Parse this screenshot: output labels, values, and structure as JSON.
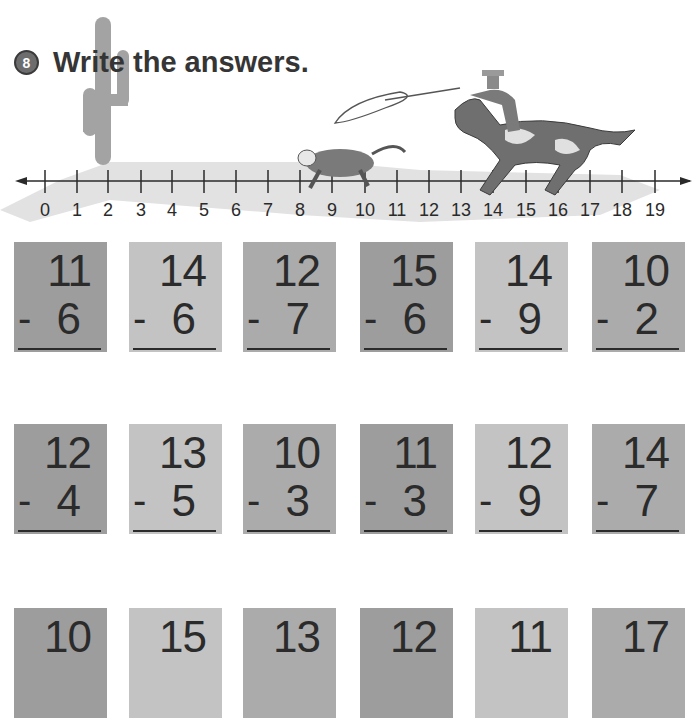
{
  "exercise": {
    "number": "8",
    "title": "Write the answers."
  },
  "number_line": {
    "labels": [
      "0",
      "1",
      "2",
      "3",
      "4",
      "5",
      "6",
      "7",
      "8",
      "9",
      "10",
      "11",
      "12",
      "13",
      "14",
      "15",
      "16",
      "17",
      "18",
      "19"
    ]
  },
  "problems": [
    [
      {
        "top": "11",
        "bottom": "6",
        "operator": "-"
      },
      {
        "top": "14",
        "bottom": "6",
        "operator": "-"
      },
      {
        "top": "12",
        "bottom": "7",
        "operator": "-"
      },
      {
        "top": "15",
        "bottom": "6",
        "operator": "-"
      },
      {
        "top": "14",
        "bottom": "9",
        "operator": "-"
      },
      {
        "top": "10",
        "bottom": "2",
        "operator": "-"
      }
    ],
    [
      {
        "top": "12",
        "bottom": "4",
        "operator": "-"
      },
      {
        "top": "13",
        "bottom": "5",
        "operator": "-"
      },
      {
        "top": "10",
        "bottom": "3",
        "operator": "-"
      },
      {
        "top": "11",
        "bottom": "3",
        "operator": "-"
      },
      {
        "top": "12",
        "bottom": "9",
        "operator": "-"
      },
      {
        "top": "14",
        "bottom": "7",
        "operator": "-"
      }
    ],
    [
      {
        "top": "10",
        "bottom": "",
        "operator": ""
      },
      {
        "top": "15",
        "bottom": "",
        "operator": ""
      },
      {
        "top": "13",
        "bottom": "",
        "operator": ""
      },
      {
        "top": "12",
        "bottom": "",
        "operator": ""
      },
      {
        "top": "11",
        "bottom": "",
        "operator": ""
      },
      {
        "top": "17",
        "bottom": "",
        "operator": ""
      }
    ]
  ]
}
